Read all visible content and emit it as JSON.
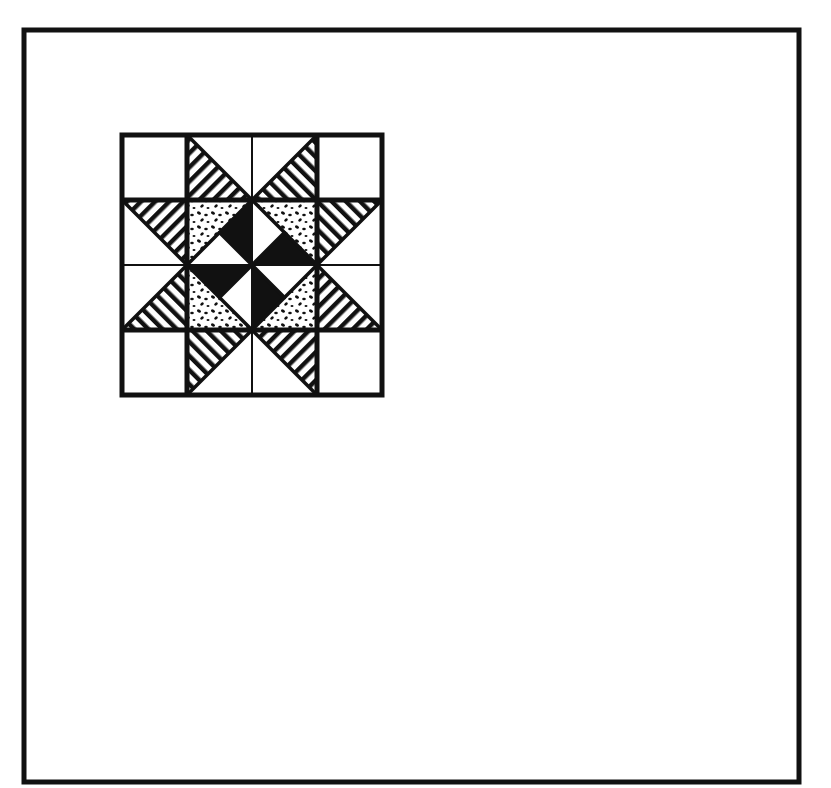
{
  "figure": {
    "canvas": {
      "width": 831,
      "height": 788,
      "background": "#ffffff"
    },
    "ink_color": "#111111",
    "frame": {
      "x": 24,
      "y": 30,
      "width": 775,
      "height": 752,
      "stroke_width": 5
    },
    "block": {
      "x": 122,
      "y": 135,
      "size": 260,
      "grid": 4,
      "cell": 65,
      "outer_stroke": 5,
      "seam_thick": 5,
      "seam_thin": 2
    },
    "fills": {
      "stripes": "diagonal-stripe",
      "speckle": "speckled-print",
      "solid": "solid-black",
      "plain": "white"
    },
    "pieces": {
      "star_points": [
        {
          "name": "star-point-top-left",
          "points": [
            [
              187,
              135
            ],
            [
              252,
              200
            ],
            [
              187,
              200
            ]
          ],
          "fill": "stripes",
          "angle": 45
        },
        {
          "name": "star-point-top-right",
          "points": [
            [
              317,
              135
            ],
            [
              252,
              200
            ],
            [
              317,
              200
            ]
          ],
          "fill": "stripes",
          "angle": -45
        },
        {
          "name": "star-point-left-upper",
          "points": [
            [
              122,
              200
            ],
            [
              187,
              200
            ],
            [
              187,
              265
            ]
          ],
          "fill": "stripes",
          "angle": 45
        },
        {
          "name": "star-point-left-lower",
          "points": [
            [
              122,
              330
            ],
            [
              187,
              330
            ],
            [
              187,
              265
            ]
          ],
          "fill": "stripes",
          "angle": -45
        },
        {
          "name": "star-point-right-upper",
          "points": [
            [
              382,
              200
            ],
            [
              317,
              200
            ],
            [
              317,
              265
            ]
          ],
          "fill": "stripes",
          "angle": -45
        },
        {
          "name": "star-point-right-lower",
          "points": [
            [
              382,
              330
            ],
            [
              317,
              330
            ],
            [
              317,
              265
            ]
          ],
          "fill": "stripes",
          "angle": 45
        },
        {
          "name": "star-point-bottom-left",
          "points": [
            [
              187,
              330
            ],
            [
              252,
              330
            ],
            [
              187,
              395
            ]
          ],
          "fill": "stripes",
          "angle": -45
        },
        {
          "name": "star-point-bottom-right",
          "points": [
            [
              252,
              330
            ],
            [
              317,
              330
            ],
            [
              317,
              395
            ]
          ],
          "fill": "stripes",
          "angle": 45
        }
      ],
      "center_speckle": [
        {
          "name": "speckle-top-left",
          "points": [
            [
              187,
              200
            ],
            [
              252,
              200
            ],
            [
              187,
              265
            ]
          ]
        },
        {
          "name": "speckle-top-right",
          "points": [
            [
              252,
              200
            ],
            [
              317,
              200
            ],
            [
              317,
              265
            ]
          ]
        },
        {
          "name": "speckle-bottom-left",
          "points": [
            [
              187,
              265
            ],
            [
              187,
              330
            ],
            [
              252,
              330
            ]
          ]
        },
        {
          "name": "speckle-bottom-right",
          "points": [
            [
              317,
              265
            ],
            [
              317,
              330
            ],
            [
              252,
              330
            ]
          ]
        }
      ],
      "pinwheel_black": [
        {
          "name": "pinwheel-blade-1",
          "points": [
            [
              252,
              200
            ],
            [
              252,
              265
            ],
            [
              219.5,
              232.5
            ]
          ]
        },
        {
          "name": "pinwheel-blade-2",
          "points": [
            [
              252,
              265
            ],
            [
              317,
              265
            ],
            [
              284.5,
              232.5
            ]
          ]
        },
        {
          "name": "pinwheel-blade-3",
          "points": [
            [
              187,
              265
            ],
            [
              252,
              265
            ],
            [
              219.5,
              297.5
            ]
          ]
        },
        {
          "name": "pinwheel-blade-4",
          "points": [
            [
              252,
              265
            ],
            [
              252,
              330
            ],
            [
              284.5,
              297.5
            ]
          ]
        }
      ],
      "pinwheel_white": [
        {
          "name": "pinwheel-light-1",
          "points": [
            [
              187,
              265
            ],
            [
              252,
              265
            ],
            [
              219.5,
              232.5
            ]
          ]
        },
        {
          "name": "pinwheel-light-2",
          "points": [
            [
              252,
              200
            ],
            [
              252,
              265
            ],
            [
              284.5,
              232.5
            ]
          ]
        },
        {
          "name": "pinwheel-light-3",
          "points": [
            [
              252,
              265
            ],
            [
              252,
              330
            ],
            [
              219.5,
              297.5
            ]
          ]
        },
        {
          "name": "pinwheel-light-4",
          "points": [
            [
              252,
              265
            ],
            [
              317,
              265
            ],
            [
              284.5,
              297.5
            ]
          ]
        }
      ],
      "diagonals": [
        [
          [
            187,
            135
          ],
          [
            252,
            200
          ]
        ],
        [
          [
            317,
            135
          ],
          [
            252,
            200
          ]
        ],
        [
          [
            122,
            200
          ],
          [
            187,
            265
          ]
        ],
        [
          [
            122,
            330
          ],
          [
            187,
            265
          ]
        ],
        [
          [
            382,
            200
          ],
          [
            317,
            265
          ]
        ],
        [
          [
            382,
            330
          ],
          [
            317,
            265
          ]
        ],
        [
          [
            187,
            395
          ],
          [
            252,
            330
          ]
        ],
        [
          [
            317,
            395
          ],
          [
            252,
            330
          ]
        ],
        [
          [
            252,
            200
          ],
          [
            187,
            265
          ]
        ],
        [
          [
            252,
            200
          ],
          [
            317,
            265
          ]
        ],
        [
          [
            187,
            265
          ],
          [
            252,
            330
          ]
        ],
        [
          [
            317,
            265
          ],
          [
            252,
            330
          ]
        ],
        [
          [
            252,
            265
          ],
          [
            219.5,
            232.5
          ]
        ],
        [
          [
            252,
            265
          ],
          [
            284.5,
            232.5
          ]
        ],
        [
          [
            252,
            265
          ],
          [
            219.5,
            297.5
          ]
        ],
        [
          [
            252,
            265
          ],
          [
            284.5,
            297.5
          ]
        ]
      ]
    }
  }
}
